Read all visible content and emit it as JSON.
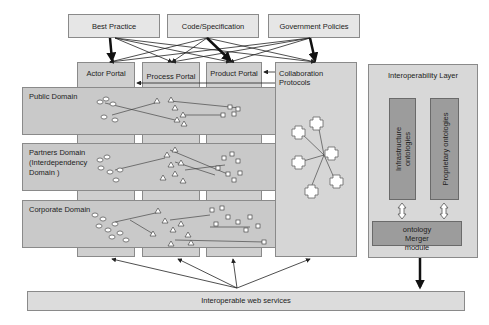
{
  "sources": [
    {
      "label": "Best Practice"
    },
    {
      "label": "Code/Specification"
    },
    {
      "label": "Government Policies"
    }
  ],
  "portals": [
    {
      "label": "Actor Portal"
    },
    {
      "label": "Process Portal"
    },
    {
      "label": "Product Portal"
    },
    {
      "label": "Collaboration Protocols"
    }
  ],
  "domains": [
    {
      "label": "Public Domain"
    },
    {
      "label": "Partners Domain (Interdependency Domain )"
    },
    {
      "label": "Corporate Domain"
    }
  ],
  "interoperability_layer": {
    "title": "Interoperability Layer",
    "infrastructure": "Infrastructure ontologies",
    "proprietary": "Proprietary ontologies",
    "merger": "ontology Merger module"
  },
  "web_services": {
    "label": "Interoperable web services"
  },
  "colors": {
    "box": "#dcdcdc",
    "portal": "#cfcfcf",
    "inner": "#9c9c9c",
    "arrow": "#222222"
  }
}
